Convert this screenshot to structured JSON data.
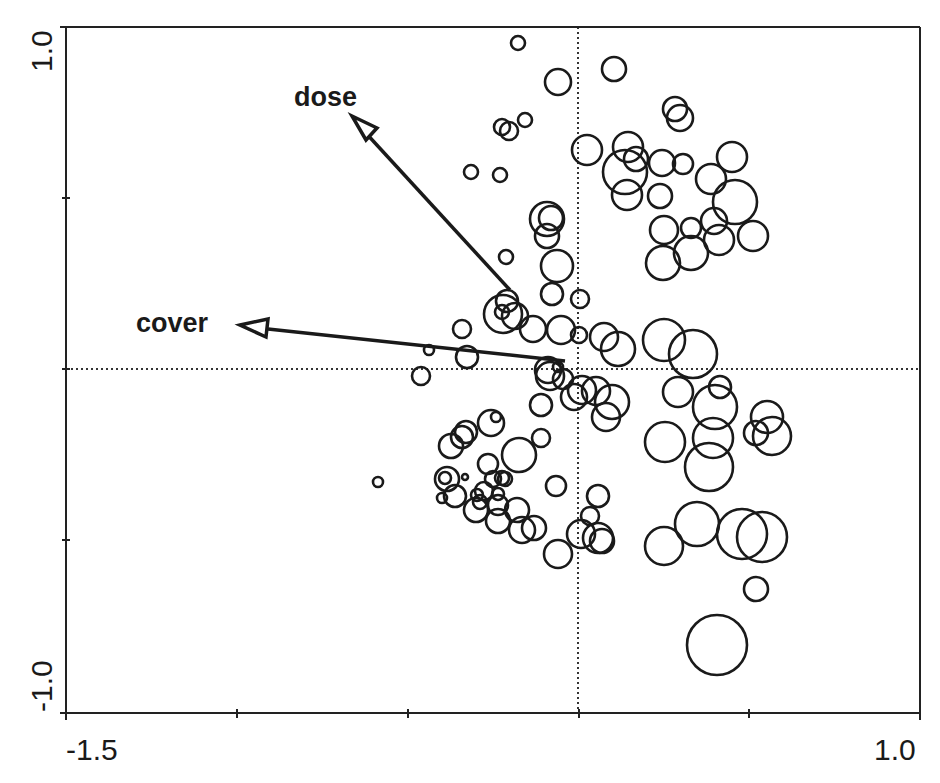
{
  "chart_data": {
    "type": "scatter",
    "subtype": "ordination biplot (bubble scatter with environmental vectors)",
    "title": "",
    "xlabel": "",
    "ylabel": "",
    "xlim": [
      -1.5,
      1.0
    ],
    "ylim": [
      -1.0,
      1.0
    ],
    "x_tick_labels": [
      "-1.5",
      "1.0"
    ],
    "y_tick_labels": [
      "1.0",
      "-1.0"
    ],
    "x_ticks": [
      -1.5,
      -1.0,
      -0.5,
      0.0,
      0.5,
      1.0
    ],
    "y_ticks": [
      -1.0,
      -0.5,
      0.0,
      0.5,
      1.0
    ],
    "grid": false,
    "zero_lines": {
      "x0": true,
      "y0": true,
      "style": "dotted"
    },
    "legend": null,
    "vectors": [
      {
        "name": "dose",
        "x_end": -0.67,
        "y_end": 0.73
      },
      {
        "name": "cover",
        "x_end": -0.99,
        "y_end": 0.13
      }
    ],
    "frame_px": {
      "left": 66,
      "top": 27,
      "right": 920,
      "bottom": 713
    },
    "origin_px": {
      "x": 578,
      "y": 369
    },
    "vector_origin_px": {
      "x": 570,
      "y": 362
    },
    "vector_tips_px": [
      {
        "name": "dose",
        "x": 352,
        "y": 118,
        "label_x": 294,
        "label_y": 106
      },
      {
        "name": "cover",
        "x": 240,
        "y": 325,
        "label_x": 136,
        "label_y": 332
      }
    ],
    "points_px": [
      [
        518,
        43,
        7
      ],
      [
        558,
        82,
        13
      ],
      [
        614,
        69,
        12
      ],
      [
        675,
        109,
        12
      ],
      [
        680,
        118,
        13
      ],
      [
        502,
        127,
        8
      ],
      [
        509,
        131,
        9
      ],
      [
        525,
        120,
        7
      ],
      [
        587,
        150,
        15
      ],
      [
        628,
        147,
        15
      ],
      [
        636,
        159,
        12
      ],
      [
        662,
        163,
        13
      ],
      [
        683,
        164,
        10
      ],
      [
        732,
        157,
        15
      ],
      [
        625,
        172,
        22
      ],
      [
        627,
        195,
        15
      ],
      [
        660,
        196,
        12
      ],
      [
        711,
        179,
        15
      ],
      [
        735,
        202,
        22
      ],
      [
        714,
        221,
        13
      ],
      [
        691,
        228,
        10
      ],
      [
        664,
        230,
        14
      ],
      [
        691,
        253,
        17
      ],
      [
        663,
        263,
        17
      ],
      [
        719,
        240,
        15
      ],
      [
        753,
        236,
        15
      ],
      [
        471,
        172,
        7
      ],
      [
        500,
        175,
        7
      ],
      [
        547,
        219,
        17
      ],
      [
        551,
        218,
        12
      ],
      [
        547,
        236,
        12
      ],
      [
        557,
        266,
        16
      ],
      [
        506,
        257,
        7
      ],
      [
        552,
        294,
        11
      ],
      [
        580,
        299,
        9
      ],
      [
        502,
        312,
        7
      ],
      [
        507,
        301,
        11
      ],
      [
        503,
        314,
        19
      ],
      [
        515,
        316,
        13
      ],
      [
        533,
        329,
        13
      ],
      [
        462,
        329,
        9
      ],
      [
        561,
        330,
        14
      ],
      [
        579,
        335,
        8
      ],
      [
        604,
        337,
        14
      ],
      [
        618,
        349,
        17
      ],
      [
        664,
        340,
        21
      ],
      [
        693,
        354,
        24
      ],
      [
        429,
        350,
        5
      ],
      [
        467,
        357,
        11
      ],
      [
        421,
        376,
        9
      ],
      [
        548,
        370,
        13
      ],
      [
        558,
        367,
        5
      ],
      [
        563,
        379,
        10
      ],
      [
        582,
        390,
        14
      ],
      [
        574,
        397,
        13
      ],
      [
        596,
        391,
        14
      ],
      [
        612,
        402,
        17
      ],
      [
        606,
        417,
        14
      ],
      [
        541,
        405,
        11
      ],
      [
        550,
        376,
        14
      ],
      [
        678,
        392,
        15
      ],
      [
        720,
        387,
        11
      ],
      [
        715,
        407,
        22
      ],
      [
        713,
        438,
        20
      ],
      [
        767,
        417,
        16
      ],
      [
        756,
        433,
        12
      ],
      [
        772,
        436,
        19
      ],
      [
        665,
        442,
        20
      ],
      [
        709,
        467,
        24
      ],
      [
        491,
        423,
        13
      ],
      [
        496,
        417,
        5
      ],
      [
        462,
        437,
        11
      ],
      [
        466,
        432,
        11
      ],
      [
        451,
        446,
        12
      ],
      [
        519,
        455,
        17
      ],
      [
        541,
        438,
        9
      ],
      [
        488,
        464,
        10
      ],
      [
        447,
        479,
        12
      ],
      [
        445,
        478,
        6
      ],
      [
        465,
        477,
        3
      ],
      [
        493,
        479,
        8
      ],
      [
        502,
        478,
        7
      ],
      [
        505,
        479,
        7
      ],
      [
        455,
        496,
        11
      ],
      [
        442,
        498,
        5
      ],
      [
        484,
        491,
        9
      ],
      [
        477,
        495,
        6
      ],
      [
        498,
        494,
        6
      ],
      [
        480,
        502,
        7
      ],
      [
        498,
        505,
        10
      ],
      [
        476,
        510,
        12
      ],
      [
        498,
        521,
        12
      ],
      [
        517,
        510,
        12
      ],
      [
        522,
        530,
        13
      ],
      [
        534,
        528,
        12
      ],
      [
        378,
        482,
        5
      ],
      [
        556,
        486,
        10
      ],
      [
        598,
        496,
        11
      ],
      [
        590,
        516,
        9
      ],
      [
        581,
        534,
        14
      ],
      [
        602,
        541,
        12
      ],
      [
        598,
        538,
        15
      ],
      [
        558,
        554,
        14
      ],
      [
        664,
        546,
        19
      ],
      [
        697,
        524,
        22
      ],
      [
        742,
        534,
        25
      ],
      [
        762,
        537,
        25
      ],
      [
        756,
        589,
        12
      ],
      [
        717,
        645,
        30
      ]
    ]
  }
}
